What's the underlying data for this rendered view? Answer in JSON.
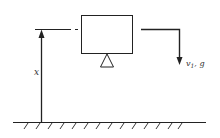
{
  "diagram": {
    "labels": {
      "height": "x",
      "velocity": "v",
      "velocity_sub": "1",
      "velocity_rest": ", g"
    },
    "colors": {
      "stroke": "#222222",
      "background": "#ffffff"
    },
    "elements": [
      "block-box",
      "pivot-triangle",
      "height-arrow",
      "reference-line",
      "output-arrow",
      "ground"
    ]
  }
}
